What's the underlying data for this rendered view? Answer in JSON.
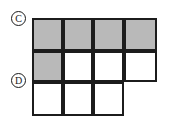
{
  "figure": {
    "background_color": "#ffffff",
    "line_color": "#1c1c1c",
    "shaded_color": "#b9b9b9",
    "blank_color": "#ffffff"
  },
  "labels": [
    {
      "id": "c",
      "text": "C",
      "style": "circled",
      "x": 11,
      "y": 11
    },
    {
      "id": "d",
      "text": "D",
      "style": "circled",
      "x": 11,
      "y": 73
    }
  ],
  "grid": {
    "origin_x": 32,
    "origin_y": 18,
    "columns": 4,
    "rows": 3,
    "column_edges": [
      0,
      31,
      61,
      92,
      125
    ],
    "row_edges": [
      0,
      33,
      64,
      98
    ],
    "cells": [
      {
        "row": 0,
        "col": 0,
        "fill": "shaded"
      },
      {
        "row": 0,
        "col": 1,
        "fill": "shaded"
      },
      {
        "row": 0,
        "col": 2,
        "fill": "shaded"
      },
      {
        "row": 0,
        "col": 3,
        "fill": "shaded"
      },
      {
        "row": 1,
        "col": 0,
        "fill": "shaded"
      },
      {
        "row": 1,
        "col": 1,
        "fill": "blank"
      },
      {
        "row": 1,
        "col": 2,
        "fill": "blank"
      },
      {
        "row": 1,
        "col": 3,
        "fill": "blank"
      },
      {
        "row": 2,
        "col": 0,
        "fill": "blank"
      },
      {
        "row": 2,
        "col": 1,
        "fill": "blank"
      },
      {
        "row": 2,
        "col": 2,
        "fill": "blank"
      }
    ]
  }
}
